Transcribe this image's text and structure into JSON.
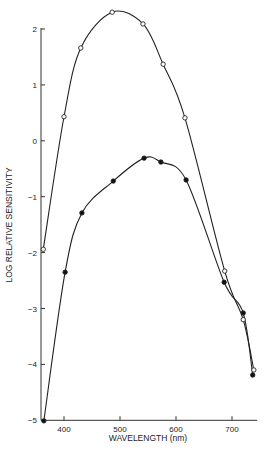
{
  "chart_data": {
    "type": "line",
    "title": "",
    "xlabel": "WAVELENGTH (nm)",
    "ylabel": "LOG RELATIVE SENSITIVITY",
    "xlim": [
      365,
      745
    ],
    "ylim": [
      -5,
      2.35
    ],
    "x_ticks": [
      400,
      500,
      600,
      700
    ],
    "y_ticks": [
      2,
      1,
      0,
      -1,
      -2,
      -3,
      -4,
      -5
    ],
    "grid": false,
    "legend": null,
    "series": [
      {
        "name": "open-circles",
        "marker": "open-circle",
        "x": [
          363,
          400,
          430,
          486,
          541,
          577,
          616,
          687,
          720,
          739
        ],
        "y": [
          -1.94,
          0.43,
          1.66,
          2.3,
          2.09,
          1.37,
          0.41,
          -2.33,
          -3.2,
          -4.1
        ]
      },
      {
        "name": "filled-circles",
        "marker": "filled-circle",
        "x": [
          364,
          402,
          432,
          488,
          543,
          573,
          618,
          686,
          720,
          737
        ],
        "y": [
          -5.01,
          -2.35,
          -1.29,
          -0.72,
          -0.31,
          -0.38,
          -0.7,
          -2.53,
          -3.08,
          -4.19
        ]
      }
    ]
  }
}
